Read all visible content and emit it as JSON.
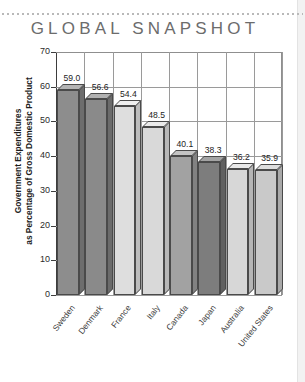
{
  "page": {
    "background": "#ffffff",
    "edge_band_color": "#f2f2f2"
  },
  "header": {
    "title": "GLOBAL SNAPSHOT",
    "title_color": "#6c6c6c"
  },
  "chart_data": {
    "type": "bar",
    "title": "GLOBAL SNAPSHOT",
    "xlabel": "",
    "ylabel": "Government Expenditures as Percentage of Gross Domestic Product",
    "ylabel_line1": "Government Expenditures",
    "ylabel_line2": "as Percentage of Gross Domestic Product",
    "ylim": [
      0,
      70
    ],
    "yticks": [
      0,
      10,
      20,
      30,
      40,
      50,
      60,
      70
    ],
    "grid": true,
    "legend": "none",
    "categories": [
      "Sweden",
      "Denmark",
      "France",
      "Italy",
      "Canada",
      "Japan",
      "Australia",
      "United States"
    ],
    "values": [
      59.0,
      56.6,
      54.4,
      48.5,
      40.1,
      38.3,
      36.2,
      35.9
    ],
    "value_labels": [
      "59.0",
      "56.6",
      "54.4",
      "48.5",
      "40.1",
      "38.3",
      "36.2",
      "35.9"
    ],
    "bar_colors": [
      "#8d8d8d",
      "#8a8a8a",
      "#dedede",
      "#d9d9d9",
      "#a2a2a2",
      "#7d7d7d",
      "#d7d7d7",
      "#c9c9c9"
    ],
    "bar_top_colors": [
      "#b4b4b4",
      "#b1b1b1",
      "#efefef",
      "#ebebeb",
      "#c4c4c4",
      "#a3a3a3",
      "#e9e9e9",
      "#dedede"
    ],
    "bar_side_colors": [
      "#6d6d6d",
      "#6b6b6b",
      "#bcbcbc",
      "#b8b8b8",
      "#828282",
      "#606060",
      "#b5b5b5",
      "#a9a9a9"
    ],
    "axis_color": "#3d3d3d",
    "grid_color": "#9a9a9a"
  }
}
